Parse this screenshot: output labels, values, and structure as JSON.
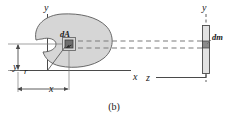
{
  "figure": {
    "caption": "(b)",
    "left_diagram": {
      "axis_y_label": "y",
      "axis_x_label": "x",
      "area_element_label": "dA",
      "radius_label": "r",
      "y_distance_label": "y",
      "x_distance_label": "x"
    },
    "right_diagram": {
      "axis_y_label": "y",
      "axis_z_label": "z",
      "mass_element_label": "dm"
    },
    "colors": {
      "blob_fill": "#d6d6d6",
      "blob_stroke": "#5a5a5a",
      "element_fill": "#6e6e6e",
      "element_stroke": "#3a3a3a",
      "bar_fill": "#e2e2e2",
      "bar_stroke": "#4a4a4a",
      "axis": "#4a4a4a",
      "dashed": "#7a7a7a",
      "text": "#1a1a1a"
    }
  }
}
